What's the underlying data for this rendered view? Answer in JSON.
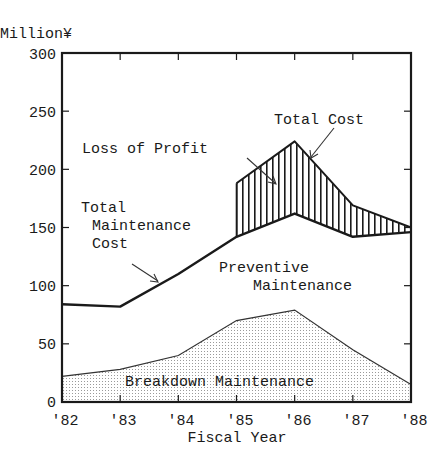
{
  "chart_data": {
    "type": "area",
    "title": "",
    "xlabel": "Fiscal Year",
    "ylabel": "Million¥",
    "categories": [
      "'82",
      "'83",
      "'84",
      "'85",
      "'86",
      "'87",
      "'88"
    ],
    "ylim": [
      0,
      300
    ],
    "yticks": [
      0,
      50,
      100,
      150,
      200,
      250,
      300
    ],
    "grid": false,
    "legend": "none (inline annotations)",
    "series": [
      {
        "name": "Total Maintenance Cost",
        "style": "thick line",
        "values": [
          84,
          82,
          110,
          142,
          162,
          142,
          146
        ]
      },
      {
        "name": "Total Cost",
        "style": "line (from '85)",
        "values": [
          null,
          null,
          null,
          188,
          224,
          169,
          150
        ]
      },
      {
        "name": "Breakdown Maintenance",
        "style": "dotted-fill area",
        "values": [
          22,
          28,
          40,
          70,
          79,
          45,
          15
        ]
      },
      {
        "name": "Loss of Profit",
        "style": "vertical-hatched band between Total Maintenance Cost and Total Cost",
        "values": [
          null,
          null,
          null,
          46,
          62,
          27,
          4
        ]
      },
      {
        "name": "Preventive Maintenance",
        "style": "region between Breakdown Maintenance and Total Maintenance Cost",
        "values": [
          62,
          54,
          70,
          72,
          83,
          97,
          131
        ]
      }
    ],
    "annotations": [
      {
        "text": "Total Cost",
        "points_to": "Total Cost line near '86"
      },
      {
        "text": "Loss of Profit",
        "points_to": "hatched band near '85-'86"
      },
      {
        "text": "Total Maintenance Cost",
        "points_to": "Total Maintenance Cost line near '84"
      },
      {
        "text": "Preventive Maintenance",
        "points_to": "area under Total Maintenance Cost"
      },
      {
        "text": "Breakdown Maintenance",
        "points_to": "dotted area"
      }
    ]
  },
  "labels": {
    "y_unit": "Million¥",
    "x_title": "Fiscal Year",
    "y_ticks": [
      "0",
      "50",
      "100",
      "150",
      "200",
      "250",
      "300"
    ],
    "x_ticks": [
      "'82",
      "'83",
      "'84",
      "'85",
      "'86",
      "'87",
      "'88"
    ],
    "total_cost": "Total Cost",
    "loss_of_profit": "Loss of Profit",
    "total_maint_1": "Total",
    "total_maint_2": "Maintenance",
    "total_maint_3": "Cost",
    "preventive_1": "Preventive",
    "preventive_2": "Maintenance",
    "breakdown": "Breakdown Maintenance"
  }
}
